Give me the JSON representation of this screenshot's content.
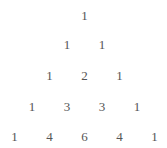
{
  "rows": [
    [
      1
    ],
    [
      1,
      1
    ],
    [
      1,
      2,
      1
    ],
    [
      1,
      3,
      3,
      1
    ],
    [
      1,
      4,
      6,
      4,
      1
    ]
  ]
}
